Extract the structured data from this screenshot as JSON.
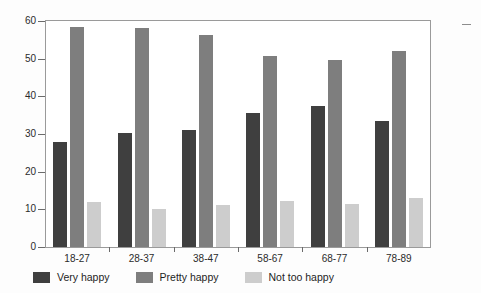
{
  "chart_data": {
    "type": "bar",
    "title": "",
    "subtitle": "",
    "xlabel": "",
    "ylabel": "",
    "categories": [
      "18-27",
      "28-37",
      "38-47",
      "58-67",
      "68-77",
      "78-89"
    ],
    "series": [
      {
        "name": "Very happy",
        "color": "#3f3f3f",
        "values": [
          27.8,
          30.3,
          31.1,
          35.5,
          37.5,
          33.4
        ]
      },
      {
        "name": "Pretty happy",
        "color": "#7e7e7e",
        "values": [
          58.5,
          58.2,
          56.2,
          50.8,
          49.6,
          52.0
        ]
      },
      {
        "name": "Not too happy",
        "color": "#cdcdcd",
        "values": [
          12.0,
          10.0,
          11.1,
          12.1,
          11.5,
          13.0
        ]
      }
    ],
    "ylim": [
      0,
      60
    ],
    "yticks": [
      0,
      10,
      20,
      30,
      40,
      50,
      60
    ],
    "ytick_labels": [
      "0",
      "10",
      "20",
      "30",
      "40",
      "50",
      "60"
    ],
    "grid": false,
    "legend_position": "bottom-left"
  },
  "legend": {
    "items": [
      {
        "label": "Very happy",
        "color": "#3f3f3f"
      },
      {
        "label": "Pretty happy",
        "color": "#7e7e7e"
      },
      {
        "label": "Not too happy",
        "color": "#cdcdcd"
      }
    ]
  },
  "axes": {
    "y_labels": [
      "60",
      "50",
      "40",
      "30",
      "20",
      "10",
      "0"
    ],
    "x_labels": [
      "18-27",
      "28-37",
      "38-47",
      "58-67",
      "68-77",
      "78-89"
    ]
  }
}
